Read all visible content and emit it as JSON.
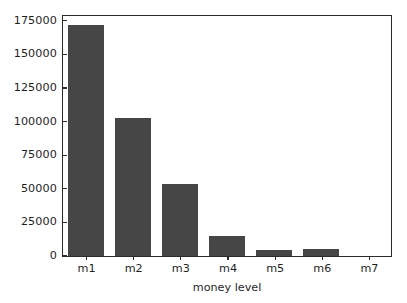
{
  "chart_data": {
    "type": "bar",
    "title": "",
    "xlabel": "money level",
    "ylabel": "",
    "categories": [
      "m1",
      "m2",
      "m3",
      "m4",
      "m5",
      "m6",
      "m7"
    ],
    "values": [
      171500,
      102700,
      53200,
      14800,
      4400,
      5200,
      0
    ],
    "ylim": [
      0,
      180000
    ],
    "yticks": [
      0,
      25000,
      50000,
      75000,
      100000,
      125000,
      150000,
      175000
    ],
    "ytick_labels": [
      "0",
      "25000",
      "50000",
      "75000",
      "100000",
      "125000",
      "150000",
      "175000"
    ],
    "grid": false,
    "legend": null,
    "bar_color": "#464646",
    "axes_color": "#2b2b2b",
    "background": "#ffffff"
  }
}
